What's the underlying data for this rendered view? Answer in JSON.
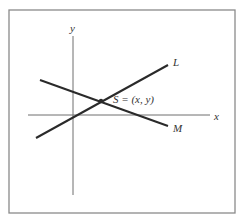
{
  "diagram": {
    "type": "intersecting-lines",
    "frame": {
      "x1": 9,
      "y1": 10,
      "x2": 235,
      "y2": 213,
      "color": "#8a8a8a"
    },
    "axes": {
      "color": "#6e6e6e",
      "x_axis": {
        "label": "x",
        "from": [
          28,
          115
        ],
        "to": [
          210,
          115
        ],
        "label_pos": [
          214,
          120
        ]
      },
      "y_axis": {
        "label": "y",
        "from": [
          73,
          36
        ],
        "to": [
          73,
          195
        ],
        "label_pos": [
          70,
          32
        ]
      }
    },
    "lines": [
      {
        "name": "L",
        "label": "L",
        "from": [
          36,
          138
        ],
        "to": [
          168,
          65
        ],
        "label_pos": [
          173,
          66
        ],
        "color": "#2a2a2a"
      },
      {
        "name": "M",
        "label": "M",
        "from": [
          40,
          80
        ],
        "to": [
          168,
          126
        ],
        "label_pos": [
          173,
          132
        ],
        "color": "#2a2a2a"
      }
    ],
    "intersection": {
      "label": "S = (x, y)",
      "point": [
        101,
        101
      ],
      "label_pos": [
        113,
        103
      ]
    }
  }
}
